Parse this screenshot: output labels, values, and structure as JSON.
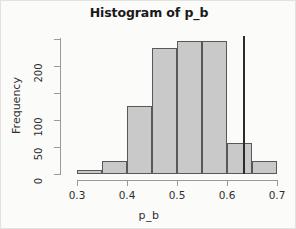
{
  "chart_data": {
    "type": "bar",
    "title": "Histogram of p_b",
    "xlabel": "p_b",
    "ylabel": "Frequency",
    "grid": false,
    "legend": false,
    "xlim": [
      0.3,
      0.7
    ],
    "ylim": [
      0,
      250
    ],
    "bin_width": 0.05,
    "bin_edges": [
      0.3,
      0.35,
      0.4,
      0.45,
      0.5,
      0.55,
      0.6,
      0.65,
      0.7
    ],
    "categories": [
      "0.30-0.35",
      "0.35-0.40",
      "0.40-0.45",
      "0.45-0.50",
      "0.50-0.55",
      "0.55-0.60",
      "0.60-0.65",
      "0.65-0.70"
    ],
    "values": [
      8,
      25,
      126,
      233,
      246,
      246,
      57,
      25
    ],
    "xticks": [
      0.3,
      0.4,
      0.5,
      0.6,
      0.7
    ],
    "xtick_labels": [
      "0.3",
      "0.4",
      "0.5",
      "0.6",
      "0.7"
    ],
    "yticks": [
      0,
      50,
      100,
      150,
      200,
      250
    ],
    "ytick_labels": [
      "0",
      "50",
      "100",
      "",
      "200",
      ""
    ],
    "annotations": [
      {
        "name": "reference-line",
        "type": "vertical-line",
        "x": 0.632,
        "color": "#2b2b2b"
      }
    ],
    "colors": {
      "bar_fill": "#c9c9c9",
      "bar_border": "#585858",
      "axis": "#9a9a9a",
      "text": "#2f2f2f",
      "title": "#1a1a1a",
      "background": "#fbfbfa"
    }
  }
}
